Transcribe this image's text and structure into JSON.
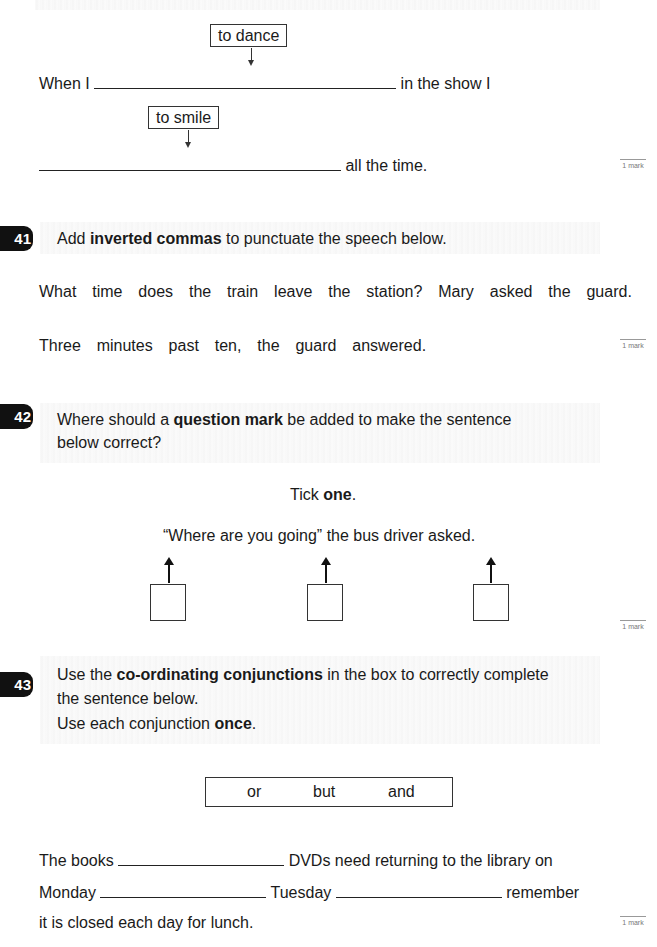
{
  "top_exercise": {
    "verb_1": "to dance",
    "line_1_start": "When I",
    "line_1_end": "in the show I",
    "verb_2": "to smile",
    "line_2_end": "all the time.",
    "mark": "1 mark"
  },
  "q41": {
    "number": "41",
    "instruction_pre": "Add ",
    "instruction_bold": "inverted commas",
    "instruction_post": " to punctuate the speech below.",
    "line_1": "What  time  does  the  train  leave  the  station?  Mary  asked  the  guard.",
    "line_2": "Three  minutes  past  ten,  the  guard  answered.",
    "mark": "1 mark"
  },
  "q42": {
    "number": "42",
    "instruction_pre": "Where should a ",
    "instruction_bold": "question mark",
    "instruction_post": " be added to make the sentence",
    "instruction_line2": "below correct?",
    "tick_pre": "Tick ",
    "tick_bold": "one",
    "tick_post": ".",
    "sentence": "“Where are you going” the bus driver asked.",
    "options": [
      "after going",
      "after closing quote",
      "after asked"
    ],
    "mark": "1 mark"
  },
  "q43": {
    "number": "43",
    "instruction_pre": "Use the ",
    "instruction_bold": "co-ordinating conjunctions",
    "instruction_post": " in the box to correctly complete",
    "instruction_line2": "the sentence below.",
    "instruction_line3_pre": "Use each conjunction ",
    "instruction_line3_bold": "once",
    "instruction_line3_post": ".",
    "conjunctions": [
      "or",
      "but",
      "and"
    ],
    "sentence_line1_start": "The books",
    "sentence_line1_end": "DVDs need returning to the library on",
    "sentence_line2_start": "Monday",
    "sentence_line2_mid": "Tuesday",
    "sentence_line2_end": "remember",
    "sentence_line3": "it is closed each day for lunch.",
    "mark": "1 mark"
  }
}
